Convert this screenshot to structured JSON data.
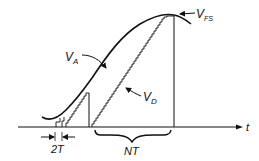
{
  "diagram": {
    "title": "",
    "labels": {
      "va": {
        "main": "V",
        "sub": "A"
      },
      "vd": {
        "main": "V",
        "sub": "D"
      },
      "vfs": {
        "main": "V",
        "sub": "FS"
      },
      "t_axis": "t",
      "two_t": "2T",
      "nt": "NT"
    },
    "colors": {
      "stroke": "#111111",
      "background": "#ffffff"
    }
  }
}
